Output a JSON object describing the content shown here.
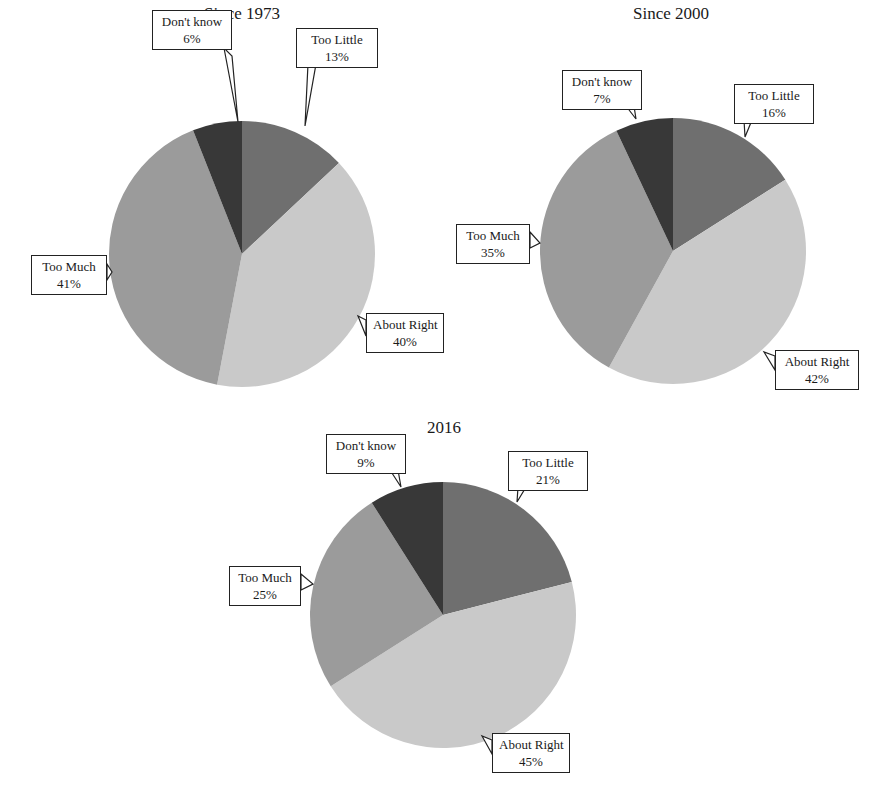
{
  "colors": {
    "too_little": "#6f6f6f",
    "about_right": "#c9c9c9",
    "too_much": "#9b9b9b",
    "dont_know": "#383838"
  },
  "chart_data": [
    {
      "type": "pie",
      "title": "Since 1973",
      "categories": [
        "Too Little",
        "About Right",
        "Too Much",
        "Don't know"
      ],
      "values": [
        13,
        40,
        41,
        6
      ],
      "labels": [
        "Too Little\n13%",
        "About Right\n40%",
        "Too Much\n41%",
        "Don't know\n6%"
      ],
      "start_angle": "12 o'clock, clockwise",
      "legend": "none (callout labels)"
    },
    {
      "type": "pie",
      "title": "Since 2000",
      "categories": [
        "Too Little",
        "About Right",
        "Too Much",
        "Don't know"
      ],
      "values": [
        16,
        42,
        35,
        7
      ],
      "labels": [
        "Too Little\n16%",
        "About Right\n42%",
        "Too Much\n35%",
        "Don't know\n7%"
      ],
      "start_angle": "12 o'clock, clockwise",
      "legend": "none (callout labels)"
    },
    {
      "type": "pie",
      "title": "2016",
      "categories": [
        "Too Little",
        "About Right",
        "Too Much",
        "Don't know"
      ],
      "values": [
        21,
        45,
        25,
        9
      ],
      "labels": [
        "Too Little\n21%",
        "About Right\n45%",
        "Too Much\n25%",
        "Don't know\n9%"
      ],
      "start_angle": "12 o'clock, clockwise",
      "legend": "none (callout labels)"
    }
  ],
  "pies": [
    {
      "title": "Since 1973",
      "callouts": {
        "too_little": {
          "name": "Too Little",
          "pct": "13%"
        },
        "about_right": {
          "name": "About Right",
          "pct": "40%"
        },
        "too_much": {
          "name": "Too Much",
          "pct": "41%"
        },
        "dont_know": {
          "name": "Don't know",
          "pct": "6%"
        }
      }
    },
    {
      "title": "Since 2000",
      "callouts": {
        "too_little": {
          "name": "Too Little",
          "pct": "16%"
        },
        "about_right": {
          "name": "About Right",
          "pct": "42%"
        },
        "too_much": {
          "name": "Too Much",
          "pct": "35%"
        },
        "dont_know": {
          "name": "Don't know",
          "pct": "7%"
        }
      }
    },
    {
      "title": "2016",
      "callouts": {
        "too_little": {
          "name": "Too Little",
          "pct": "21%"
        },
        "about_right": {
          "name": "About Right",
          "pct": "45%"
        },
        "too_much": {
          "name": "Too Much",
          "pct": "25%"
        },
        "dont_know": {
          "name": "Don't know",
          "pct": "9%"
        }
      }
    }
  ]
}
